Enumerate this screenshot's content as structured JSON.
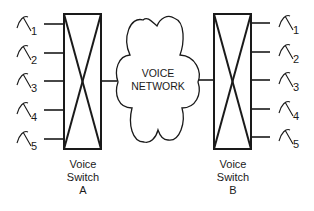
{
  "diagram": {
    "network": {
      "line1": "VOICE",
      "line2": "NETWORK"
    },
    "switch_a": {
      "line1": "Voice",
      "line2": "Switch",
      "line3": "A"
    },
    "switch_b": {
      "line1": "Voice",
      "line2": "Switch",
      "line3": "B"
    },
    "phones_a": [
      {
        "label": "1"
      },
      {
        "label": "2"
      },
      {
        "label": "3"
      },
      {
        "label": "4"
      },
      {
        "label": "5"
      }
    ],
    "phones_b": [
      {
        "label": "1"
      },
      {
        "label": "2"
      },
      {
        "label": "3"
      },
      {
        "label": "4"
      },
      {
        "label": "5"
      }
    ],
    "icons": {
      "phone": "telephone-handset-icon",
      "switch": "crossbar-switch-icon",
      "network": "cloud-icon"
    },
    "colors": {
      "stroke": "#1a1a1a",
      "background": "#ffffff"
    }
  }
}
